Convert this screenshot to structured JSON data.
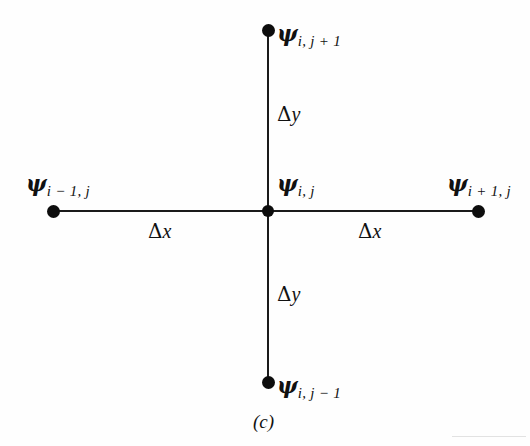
{
  "figure": {
    "caption": "(c)",
    "nodes": [
      {
        "id": "top",
        "glyph": "ψ",
        "subscript": "i, j + 1",
        "x": 268,
        "y": 30
      },
      {
        "id": "left",
        "glyph": "ψ",
        "subscript": "i − 1, j",
        "x": 53,
        "y": 211
      },
      {
        "id": "center",
        "glyph": "ψ",
        "subscript": "i, j",
        "x": 268,
        "y": 211
      },
      {
        "id": "right",
        "glyph": "ψ",
        "subscript": "i + 1, j",
        "x": 478,
        "y": 211
      },
      {
        "id": "bottom",
        "glyph": "ψ",
        "subscript": "i, j − 1",
        "x": 268,
        "y": 382
      }
    ],
    "spacing_labels": [
      {
        "id": "dy-upper",
        "delta": "Δ",
        "variable": "y",
        "x": 262,
        "y": 105
      },
      {
        "id": "dy-lower",
        "delta": "Δ",
        "variable": "y",
        "x": 262,
        "y": 285
      },
      {
        "id": "dx-left",
        "delta": "Δ",
        "variable": "x",
        "x": 152,
        "y": 222
      },
      {
        "id": "dx-right",
        "delta": "Δ",
        "variable": "x",
        "x": 360,
        "y": 222
      }
    ],
    "colors": {
      "line": "#1a1a1a",
      "node": "#0d0d0d",
      "text": "#111111",
      "background": "#fefefe"
    }
  }
}
